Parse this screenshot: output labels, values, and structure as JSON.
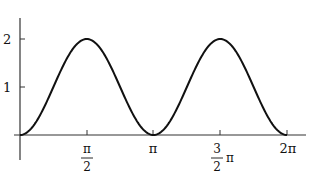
{
  "chart_data": {
    "type": "line",
    "title": "",
    "xlabel": "",
    "ylabel": "",
    "function": "y = 1 - cos(2x)",
    "xlim": [
      0,
      6.2832
    ],
    "ylim": [
      0,
      2.3
    ],
    "grid": false,
    "legend": null,
    "x_ticks": [
      {
        "value": 1.5708,
        "label_num": "π",
        "label_den": "2",
        "label": "π/2"
      },
      {
        "value": 3.1416,
        "label": "π"
      },
      {
        "value": 4.7124,
        "label_num": "3",
        "label_den": "2",
        "label_suffix": "π",
        "label": "3/2 π"
      },
      {
        "value": 6.2832,
        "label": "2π"
      }
    ],
    "y_ticks": [
      {
        "value": 1,
        "label": "1"
      },
      {
        "value": 2,
        "label": "2"
      }
    ],
    "series": [
      {
        "name": "curve",
        "color": "#111111",
        "x": [
          0,
          0.3927,
          0.7854,
          1.1781,
          1.5708,
          1.9635,
          2.3562,
          2.7489,
          3.1416,
          3.5343,
          3.927,
          4.3197,
          4.7124,
          5.1051,
          5.4978,
          5.8905,
          6.2832
        ],
        "y": [
          0,
          0.293,
          1.0,
          1.707,
          2.0,
          1.707,
          1.0,
          0.293,
          0,
          0.293,
          1.0,
          1.707,
          2.0,
          1.707,
          1.0,
          0.293,
          0
        ]
      }
    ]
  }
}
